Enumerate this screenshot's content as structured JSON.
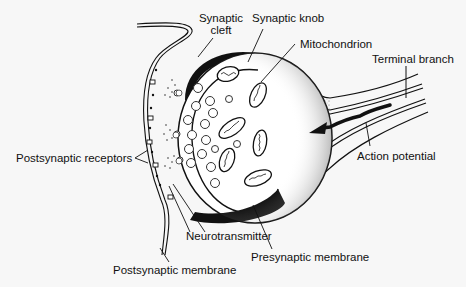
{
  "diagram": {
    "type": "anatomical-illustration",
    "background": "#f7f7f7",
    "ink_color": "#111111",
    "labels": {
      "synaptic_cleft_line1": "Synaptic",
      "synaptic_cleft_line2": "cleft",
      "synaptic_knob": "Synaptic knob",
      "mitochondrion": "Mitochondrion",
      "terminal_branch": "Terminal branch",
      "postsynaptic_receptors": "Postsynaptic receptors",
      "action_potential": "Action potential",
      "neurotransmitter": "Neurotransmitter",
      "presynaptic_membrane": "Presynaptic membrane",
      "postsynaptic_membrane": "Postsynaptic membrane"
    },
    "structures": [
      "synaptic knob",
      "terminal branch",
      "synaptic vesicles",
      "mitochondria",
      "synaptic cleft",
      "postsynaptic membrane with receptors",
      "action potential arrow"
    ]
  }
}
